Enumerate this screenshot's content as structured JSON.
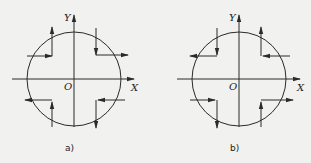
{
  "panels": [
    {
      "id": "a",
      "caption": "a)",
      "axis_labels": {
        "x": "X",
        "y": "Y",
        "origin": "O"
      },
      "center": [
        74,
        79
      ],
      "radius": 47,
      "paths": [
        {
          "quadrant": "top-left",
          "description": "horizontal rightward then vertical upward"
        },
        {
          "quadrant": "top-right",
          "description": "vertical downward then horizontal rightward"
        },
        {
          "quadrant": "bottom-left",
          "description": "vertical upward then horizontal leftward"
        },
        {
          "quadrant": "bottom-right",
          "description": "horizontal leftward then vertical downward"
        }
      ]
    },
    {
      "id": "b",
      "caption": "b)",
      "axis_labels": {
        "x": "X",
        "y": "Y",
        "origin": "O"
      },
      "center": [
        239,
        79
      ],
      "radius": 47,
      "paths": [
        {
          "quadrant": "top-left",
          "description": "vertical downward then horizontal leftward"
        },
        {
          "quadrant": "top-right",
          "description": "horizontal leftward then vertical upward"
        },
        {
          "quadrant": "bottom-left",
          "description": "horizontal rightward then vertical downward"
        },
        {
          "quadrant": "bottom-right",
          "description": "vertical upward then horizontal rightward"
        }
      ]
    }
  ],
  "colors": {
    "line": "#2a2a2a",
    "background": "#f1f1ef"
  }
}
